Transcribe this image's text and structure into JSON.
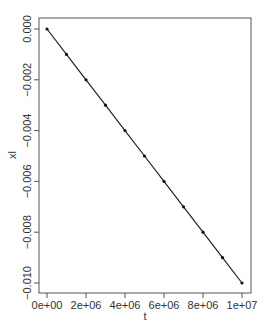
{
  "chart_data": {
    "type": "line",
    "title": "",
    "xlabel": "t",
    "ylabel": "xl",
    "x": [
      0,
      1000000,
      2000000,
      3000000,
      4000000,
      5000000,
      6000000,
      7000000,
      8000000,
      9000000,
      10000000
    ],
    "series": [
      {
        "name": "xl",
        "values": [
          0.0,
          -0.001,
          -0.002,
          -0.003,
          -0.004,
          -0.005,
          -0.006,
          -0.007,
          -0.008,
          -0.009,
          -0.01
        ],
        "markers": true,
        "line": true
      }
    ],
    "xlim": [
      0,
      10000000
    ],
    "ylim": [
      -0.01,
      0.0
    ],
    "x_ticks": [
      0,
      2000000,
      4000000,
      6000000,
      8000000,
      10000000
    ],
    "x_tick_labels": [
      "0e+00",
      "2e+06",
      "4e+06",
      "6e+06",
      "8e+06",
      "1e+07"
    ],
    "y_ticks": [
      0.0,
      -0.002,
      -0.004,
      -0.006,
      -0.008,
      -0.01
    ],
    "y_tick_labels": [
      "0.000",
      "−0.002",
      "−0.004",
      "−0.006",
      "−0.008",
      "−0.010"
    ],
    "grid": false,
    "legend": null
  },
  "colors": {
    "line": "#222222",
    "marker": "#111111",
    "frame": "#555555"
  }
}
